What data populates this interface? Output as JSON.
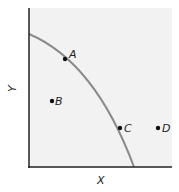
{
  "diagram": {
    "type": "production_possibilities_frontier",
    "x_axis_label": "X",
    "y_axis_label": "Y",
    "curve_color": "#8a8a8a",
    "plot_background": "#f2f2f2",
    "points": [
      {
        "label": "A",
        "position": "on curve, upper left"
      },
      {
        "label": "B",
        "position": "inside curve"
      },
      {
        "label": "C",
        "position": "on curve, lower right"
      },
      {
        "label": "D",
        "position": "outside curve"
      }
    ]
  }
}
